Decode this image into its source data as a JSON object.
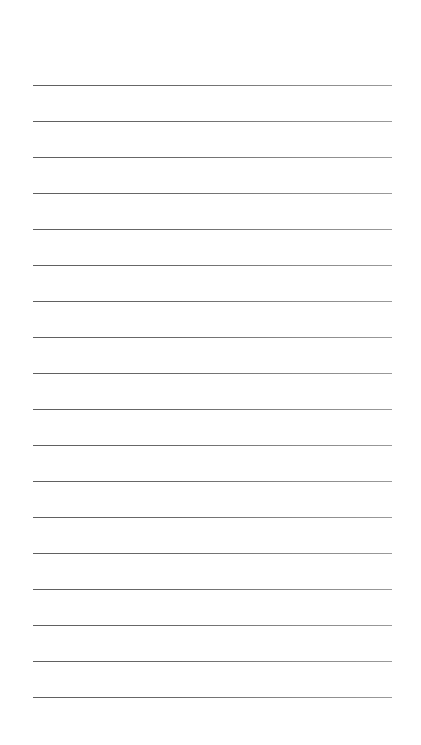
{
  "page": {
    "type": "lined-paper",
    "background_color": "#ffffff",
    "line_color": "#6a6a6a",
    "line_count": 18,
    "first_line_y": 85,
    "line_spacing": 36,
    "line_left": 33,
    "line_right": 392
  }
}
